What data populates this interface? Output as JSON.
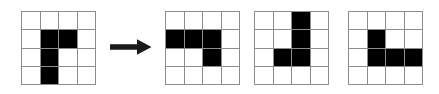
{
  "figure": {
    "type": "grid-transformation-sequence",
    "background_color": "#ffffff",
    "gridline_color": "#8d8d8d",
    "fill_color": "#000000",
    "grid_rows": 4,
    "grid_columns": 4,
    "arrow": {
      "icon": "arrow-right-icon",
      "direction": "right",
      "color": "#1a1a1a"
    },
    "shapes": [
      {
        "label": "shape-1",
        "position": "before-arrow",
        "filled_cells": [
          [
            2,
            2
          ],
          [
            2,
            3
          ],
          [
            3,
            2
          ],
          [
            4,
            2
          ]
        ],
        "cells": [
          [
            0,
            0,
            0,
            0
          ],
          [
            0,
            1,
            1,
            0
          ],
          [
            0,
            1,
            0,
            0
          ],
          [
            0,
            1,
            0,
            0
          ]
        ]
      },
      {
        "label": "shape-2",
        "position": "after-arrow-1",
        "filled_cells": [
          [
            2,
            1
          ],
          [
            2,
            2
          ],
          [
            2,
            3
          ],
          [
            3,
            3
          ]
        ],
        "cells": [
          [
            0,
            0,
            0,
            0
          ],
          [
            1,
            1,
            1,
            0
          ],
          [
            0,
            0,
            1,
            0
          ],
          [
            0,
            0,
            0,
            0
          ]
        ]
      },
      {
        "label": "shape-3",
        "position": "after-arrow-2",
        "filled_cells": [
          [
            1,
            3
          ],
          [
            2,
            3
          ],
          [
            3,
            2
          ],
          [
            3,
            3
          ]
        ],
        "cells": [
          [
            0,
            0,
            1,
            0
          ],
          [
            0,
            0,
            1,
            0
          ],
          [
            0,
            1,
            1,
            0
          ],
          [
            0,
            0,
            0,
            0
          ]
        ]
      },
      {
        "label": "shape-4",
        "position": "after-arrow-3",
        "filled_cells": [
          [
            2,
            2
          ],
          [
            3,
            2
          ],
          [
            3,
            3
          ],
          [
            3,
            4
          ]
        ],
        "cells": [
          [
            0,
            0,
            0,
            0
          ],
          [
            0,
            1,
            0,
            0
          ],
          [
            0,
            1,
            1,
            1
          ],
          [
            0,
            0,
            0,
            0
          ]
        ]
      }
    ]
  }
}
